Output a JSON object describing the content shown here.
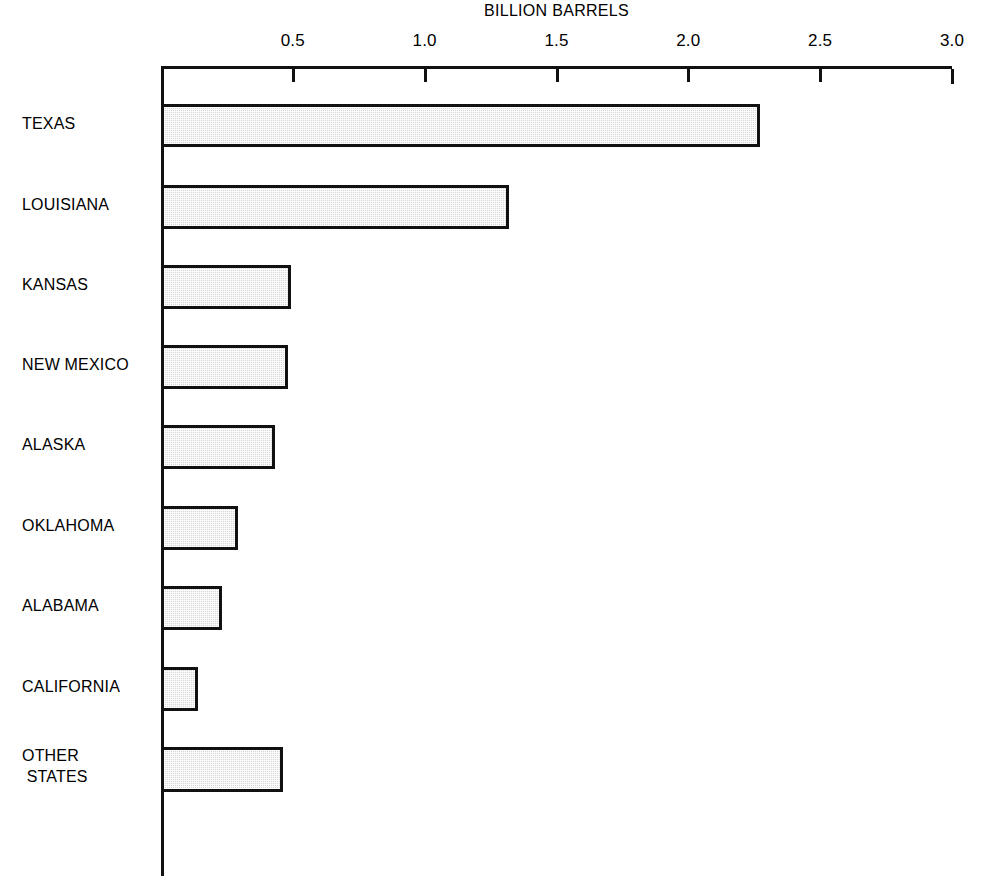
{
  "chart_data": {
    "type": "bar",
    "orientation": "horizontal",
    "title": "BILLION BARRELS",
    "xlabel": "BILLION BARRELS",
    "ylabel": "",
    "xlim": [
      0,
      3.0
    ],
    "ylim": null,
    "grid": false,
    "legend": null,
    "xticks": [
      0.5,
      1.0,
      1.5,
      2.0,
      2.5,
      3.0
    ],
    "xtick_labels": [
      "0.5",
      "1.0",
      "1.5",
      "2.0",
      "2.5",
      "3.0"
    ],
    "categories": [
      "TEXAS",
      "LOUISIANA",
      "KANSAS",
      "NEW MEXICO",
      "ALASKA",
      "OKLAHOMA",
      "ALABAMA",
      "CALIFORNIA",
      "OTHER\nSTATES"
    ],
    "values": [
      2.26,
      1.31,
      0.48,
      0.47,
      0.42,
      0.28,
      0.22,
      0.13,
      0.45
    ],
    "bar_fill_color": "#d6d6d6",
    "bar_edge_color": "#111111",
    "axis_color": "#111111",
    "background_color": "#ffffff"
  },
  "bars": [
    {
      "label": "TEXAS",
      "value": 2.26,
      "top": 104,
      "height": 43,
      "label_top": 113
    },
    {
      "label": "LOUISIANA",
      "value": 1.31,
      "top": 185,
      "height": 44,
      "label_top": 194
    },
    {
      "label": "KANSAS",
      "value": 0.48,
      "top": 265,
      "height": 44,
      "label_top": 274
    },
    {
      "label": "NEW MEXICO",
      "value": 0.47,
      "top": 345,
      "height": 44,
      "label_top": 354
    },
    {
      "label": "ALASKA",
      "value": 0.42,
      "top": 425,
      "height": 44,
      "label_top": 434
    },
    {
      "label": "OKLAHOMA",
      "value": 0.28,
      "top": 506,
      "height": 44,
      "label_top": 515
    },
    {
      "label": "ALABAMA",
      "value": 0.22,
      "top": 586,
      "height": 44,
      "label_top": 595
    },
    {
      "label": "CALIFORNIA",
      "value": 0.13,
      "top": 667,
      "height": 44,
      "label_top": 676
    },
    {
      "label": "OTHER\n STATES",
      "value": 0.45,
      "top": 747,
      "height": 45,
      "label_top": 745
    }
  ],
  "ticks": [
    {
      "label": "0.5",
      "value": 0.5
    },
    {
      "label": "1.0",
      "value": 1.0
    },
    {
      "label": "1.5",
      "value": 1.5
    },
    {
      "label": "2.0",
      "value": 2.0
    },
    {
      "label": "2.5",
      "value": 2.5
    },
    {
      "label": "3.0",
      "value": 3.0
    }
  ],
  "geometry": {
    "axis_left_px": 161,
    "axis_right_px": 952,
    "axis_top_px": 66,
    "x_max": 3.0
  }
}
